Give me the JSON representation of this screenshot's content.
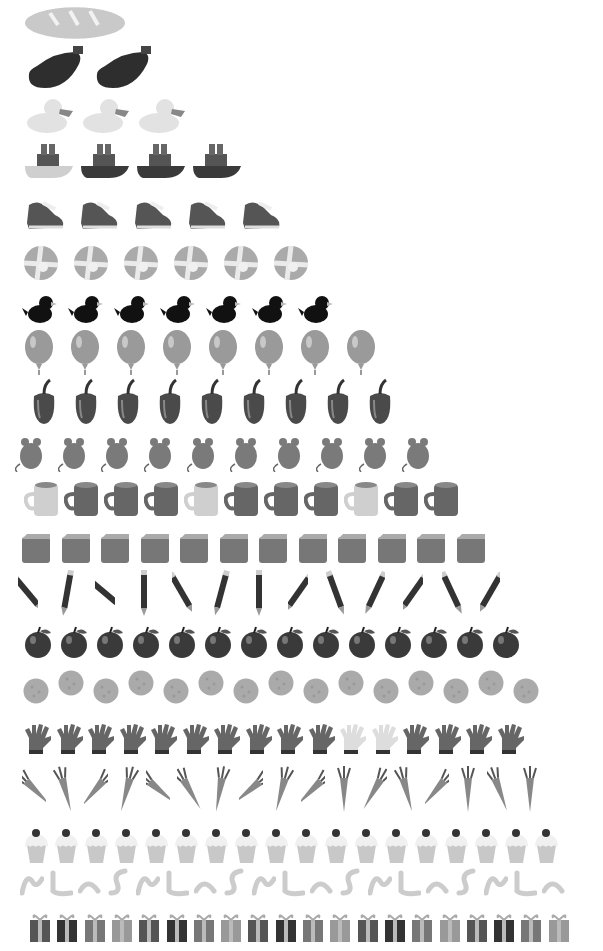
{
  "rows": [
    {
      "count": 1,
      "object": "bread",
      "y": 5,
      "x0": 25,
      "step": 0,
      "w": 100,
      "h": 36,
      "tone": "#c9c9c9"
    },
    {
      "count": 2,
      "object": "eggplant",
      "y": 44,
      "x0": 25,
      "step": 68,
      "w": 60,
      "h": 44,
      "tone": "#2e2e2e"
    },
    {
      "count": 3,
      "object": "duck",
      "y": 95,
      "x0": 25,
      "step": 56,
      "w": 50,
      "h": 38,
      "tone": "#e2e2e2"
    },
    {
      "count": 4,
      "object": "boat",
      "y": 140,
      "x0": 23,
      "step": 56,
      "w": 52,
      "h": 40,
      "tone": "#3a3a3a"
    },
    {
      "count": 5,
      "object": "shoe",
      "y": 193,
      "x0": 25,
      "step": 54,
      "w": 40,
      "h": 38,
      "tone": "#555555"
    },
    {
      "count": 6,
      "object": "ball",
      "y": 245,
      "x0": 23,
      "step": 50,
      "w": 36,
      "h": 36,
      "tone": "#aaaaaa"
    },
    {
      "count": 7,
      "object": "bird",
      "y": 290,
      "x0": 22,
      "step": 46,
      "w": 36,
      "h": 36,
      "tone": "#111111"
    },
    {
      "count": 8,
      "object": "balloon",
      "y": 330,
      "x0": 23,
      "step": 46,
      "w": 32,
      "h": 45,
      "tone": "#9a9a9a"
    },
    {
      "count": 9,
      "object": "pepper",
      "y": 378,
      "x0": 30,
      "step": 42,
      "w": 28,
      "h": 48,
      "tone": "#4a4a4a"
    },
    {
      "count": 10,
      "object": "mouse",
      "y": 430,
      "x0": 15,
      "step": 43,
      "w": 32,
      "h": 42,
      "tone": "#7a7a7a"
    },
    {
      "count": 11,
      "object": "mug",
      "y": 480,
      "x0": 24,
      "step": 40,
      "w": 36,
      "h": 38,
      "tone": "#666666"
    },
    {
      "count": 12,
      "object": "block",
      "y": 533,
      "x0": 21,
      "step": 39.5,
      "w": 30,
      "h": 31,
      "tone": "#777777"
    },
    {
      "count": 13,
      "object": "pencil",
      "y": 570,
      "x0": 18,
      "step": 38.5,
      "w": 20,
      "h": 46,
      "tone": "#333333"
    },
    {
      "count": 14,
      "object": "apple",
      "y": 625,
      "x0": 23,
      "step": 36,
      "w": 30,
      "h": 36,
      "tone": "#3a3a3a"
    },
    {
      "count": 15,
      "object": "cookie",
      "y": 676,
      "x0": 23,
      "step": 35,
      "w": 26,
      "h": 26,
      "tone": "#aaaaaa"
    },
    {
      "count": 16,
      "object": "glove",
      "y": 722,
      "x0": 23,
      "step": 31.5,
      "w": 30,
      "h": 32,
      "tone": "#666666"
    },
    {
      "count": 17,
      "object": "carrot",
      "y": 766,
      "x0": 22,
      "step": 31,
      "w": 24,
      "h": 46,
      "tone": "#888888"
    },
    {
      "count": 18,
      "object": "cupcake",
      "y": 827,
      "x0": 23,
      "step": 30,
      "w": 27,
      "h": 38,
      "tone": "#b0b0b0"
    },
    {
      "count": 19,
      "object": "worm",
      "y": 867,
      "x0": 20,
      "step": 29,
      "w": 24,
      "h": 30,
      "tone": "#cccccc"
    },
    {
      "count": 20,
      "object": "gift",
      "y": 912,
      "x0": 28,
      "step": 27.3,
      "w": 24,
      "h": 32,
      "tone": "#555555"
    }
  ]
}
